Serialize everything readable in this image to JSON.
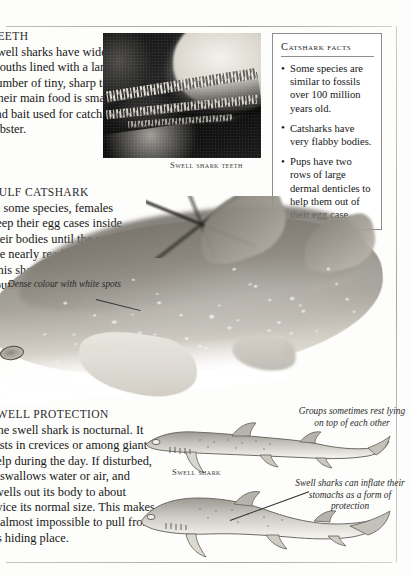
{
  "page": {
    "background_color": "#fdfdfb",
    "rule_color": "#a8a8a8"
  },
  "teeth_section": {
    "heading": "TEETH",
    "body": "Swell sharks have wide mouths lined with a large number of tiny, sharp teeth. Their main food is small fish and bait used for catching lobster."
  },
  "teeth_photo": {
    "caption": "Swell shark teeth",
    "alt_name": "swell-shark-teeth-photograph"
  },
  "facts_box": {
    "title": "Catshark facts",
    "items": [
      "Some species are similar to fossils over 100 million years old.",
      "Catsharks have very flabby bodies.",
      "Pups have two rows of large dermal denticles to help them out of their egg case."
    ],
    "border_color": "#8e8e8e"
  },
  "gulf_section": {
    "heading": "GULF CATSHARK",
    "body": "In some species, females keep their egg cases inside their bodies until the young are nearly ready to hatch. This shark lives in the sea south of Australia."
  },
  "big_shark": {
    "annotation": "Dense colour with white spots",
    "alt_name": "gulf-catshark-illustration"
  },
  "swell_protection": {
    "heading": "SWELL PROTECTION",
    "body": "The swell shark is nocturnal. It rests in crevices or among giant kelp during the day. If disturbed, it swallows water or air, and swells out its body to about twice its normal size. This makes it almost impossible to pull from its hiding place."
  },
  "bottom_sharks": {
    "upper_label": "Swell shark",
    "upper_annotation": "Groups sometimes rest lying on top of each other",
    "lower_annotation": "Swell sharks can inflate their stomachs as a form of protection"
  }
}
